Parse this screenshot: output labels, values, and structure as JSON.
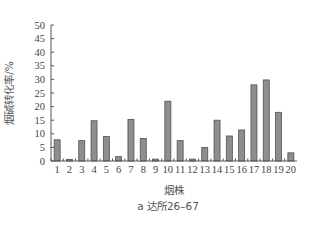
{
  "chart_data": {
    "type": "bar",
    "title": "",
    "caption": "a  达所26–67",
    "xlabel": "烟株",
    "ylabel": "烟碱转化率/%",
    "ylim": [
      0,
      50
    ],
    "yticks": [
      0,
      5,
      10,
      15,
      20,
      25,
      30,
      35,
      40,
      45,
      50
    ],
    "categories": [
      "1",
      "2",
      "3",
      "4",
      "5",
      "6",
      "7",
      "8",
      "9",
      "10",
      "11",
      "12",
      "13",
      "14",
      "15",
      "16",
      "17",
      "18",
      "19",
      "20"
    ],
    "values": [
      7.8,
      0.6,
      7.5,
      14.8,
      9.0,
      1.6,
      15.3,
      8.3,
      0.7,
      22.0,
      7.5,
      0.7,
      5.0,
      15.0,
      9.2,
      11.4,
      28.0,
      29.8,
      17.9,
      3.0
    ],
    "grid": false,
    "legend": null,
    "colors": {
      "bar_fill": "#8e8e8e",
      "bar_stroke": "#505050",
      "axis": "#555555"
    }
  }
}
